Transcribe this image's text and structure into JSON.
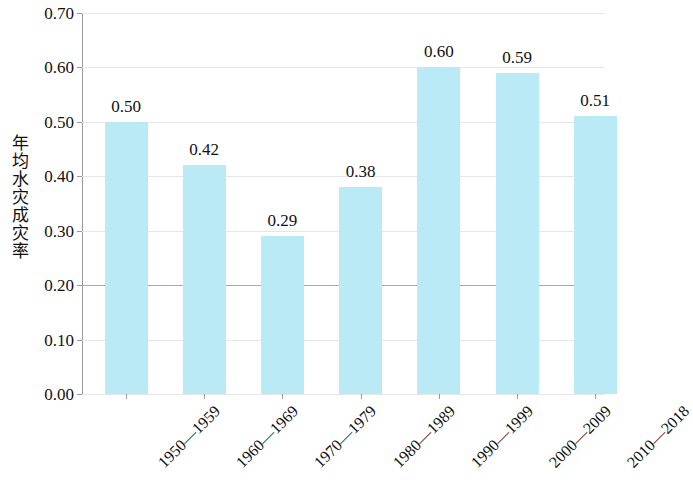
{
  "chart_data": {
    "type": "bar",
    "title": "",
    "subtitle": "",
    "xlabel": "",
    "ylabel": "年均水灾成灾率",
    "categories": [
      "1950—1959",
      "1960—1969",
      "1970—1979",
      "1980—1989",
      "1990—1999",
      "2000—2009",
      "2010—2018"
    ],
    "values": [
      0.5,
      0.42,
      0.29,
      0.38,
      0.6,
      0.59,
      0.51
    ],
    "value_labels": [
      "0.50",
      "0.42",
      "0.29",
      "0.38",
      "0.60",
      "0.59",
      "0.51"
    ],
    "ylim": [
      0.0,
      0.7
    ],
    "ytick_values": [
      0.0,
      0.1,
      0.2,
      0.3,
      0.4,
      0.5,
      0.6,
      0.7
    ],
    "ytick_labels": [
      "0.00",
      "0.10",
      "0.20",
      "0.30",
      "0.40",
      "0.50",
      "0.60",
      "0.70"
    ],
    "grid": true,
    "grid_axis": "y",
    "legend": false,
    "legend_position": "none",
    "bar_color": "#b9eaf6",
    "grid_color": "#e6e6e6",
    "axis_color": "#9a9a9a",
    "major_gridline_value": 0.2,
    "major_gridline_color": "#a8a8a8",
    "text_color": "#111111",
    "xlabel_rotation_deg": -45,
    "series": [
      {
        "name": "年均水灾成灾率",
        "values": [
          0.5,
          0.42,
          0.29,
          0.38,
          0.6,
          0.59,
          0.51
        ]
      }
    ]
  }
}
